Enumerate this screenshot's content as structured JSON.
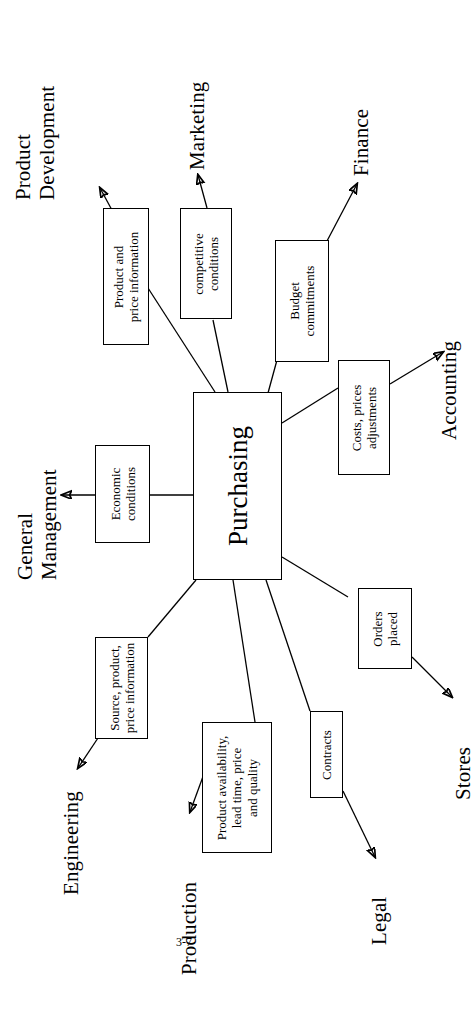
{
  "slide": {
    "page_number": "3-7",
    "hub": {
      "label": "Purchasing"
    }
  },
  "diagram": {
    "type": "hub-and-spoke",
    "hub": "Purchasing",
    "departments": [
      {
        "id": "product-development",
        "label": "Product\nDevelopment",
        "direction": "outgoing"
      },
      {
        "id": "marketing",
        "label": "Marketing",
        "direction": "outgoing"
      },
      {
        "id": "finance",
        "label": "Finance",
        "direction": "outgoing"
      },
      {
        "id": "accounting",
        "label": "Accounting",
        "direction": "outgoing"
      },
      {
        "id": "stores",
        "label": "Stores",
        "direction": "outgoing"
      },
      {
        "id": "legal",
        "label": "Legal",
        "direction": "outgoing"
      },
      {
        "id": "production",
        "label": "Production",
        "direction": "outgoing"
      },
      {
        "id": "engineering",
        "label": "Engineering",
        "direction": "outgoing"
      },
      {
        "id": "general-management",
        "label": "General\nManagement",
        "direction": "outgoing"
      }
    ],
    "flows": [
      {
        "id": "product-and-price-information",
        "label": "Product and\nprice information",
        "to": "product-development"
      },
      {
        "id": "competitive-conditions",
        "label": "competitive\nconditions",
        "to": "marketing"
      },
      {
        "id": "budget-commitments",
        "label": "Budget\ncommitments",
        "to": "finance"
      },
      {
        "id": "costs-prices-adjustments",
        "label": "Costs, prices\nadjustments",
        "to": "accounting"
      },
      {
        "id": "orders-placed",
        "label": "Orders\nplaced",
        "to": "stores"
      },
      {
        "id": "contracts",
        "label": "Contracts",
        "to": "legal"
      },
      {
        "id": "product-availability",
        "label": "Product availability,\nlead time, price\nand quality",
        "to": "production"
      },
      {
        "id": "source-product-price-information",
        "label": "Source, product,\nprice information",
        "to": "engineering"
      },
      {
        "id": "economic-conditions",
        "label": "Economic\nconditions",
        "to": "general-management"
      }
    ]
  }
}
